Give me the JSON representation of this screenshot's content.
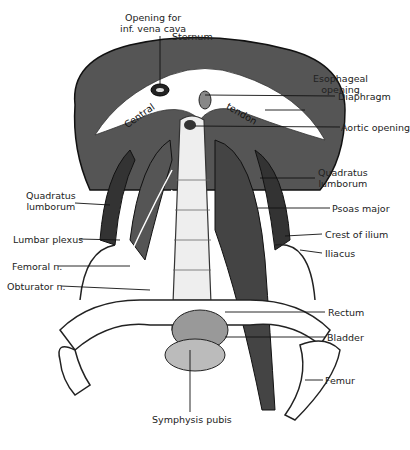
{
  "figure": {
    "labels": {
      "opening_ivc_1": "Opening for",
      "opening_ivc_2": "inf. vena cava",
      "sternum": "Sternum",
      "esophageal_1": "Esophageal",
      "esophageal_2": "opening",
      "diaphragm": "Diaphragm",
      "aortic": "Aortic opening",
      "central": "Central",
      "tendon": "tendon",
      "quadratus_right_1": "Quadratus",
      "quadratus_right_2": "lumborum",
      "psoas": "Psoas major",
      "crest": "Crest of ilium",
      "iliacus": "Iliacus",
      "rectum": "Rectum",
      "bladder": "Bladder",
      "femur": "Femur",
      "symphysis": "Symphysis pubis",
      "quadratus_left_1": "Quadratus",
      "quadratus_left_2": "lumborum",
      "lumbar_plexus": "Lumbar plexus",
      "femoral": "Femoral n.",
      "obturator": "Obturator n."
    }
  }
}
